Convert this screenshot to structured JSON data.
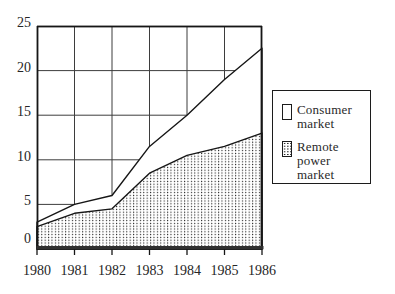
{
  "figure": {
    "background": "#ffffff",
    "line_color": "#161616",
    "grid_color": "#3d3d3d",
    "text_color": "#262626"
  },
  "chart_data": {
    "type": "area",
    "stacked": true,
    "title": "",
    "xlabel": "",
    "ylabel": "",
    "x": [
      1980,
      1981,
      1982,
      1983,
      1984,
      1985,
      1986
    ],
    "x_tick_labels": [
      "1980",
      "1981",
      "1982",
      "1983",
      "1984",
      "1985",
      "1986"
    ],
    "y_ticks": [
      0,
      5,
      10,
      15,
      20,
      25
    ],
    "y_tick_labels": [
      "0",
      "5",
      "10",
      "15",
      "20",
      "25"
    ],
    "ylim": [
      0,
      25
    ],
    "grid": true,
    "series": [
      {
        "name": "Remote power market",
        "fill": "dot-pattern",
        "values": [
          2.5,
          4,
          4.5,
          8.5,
          10.5,
          11.5,
          13
        ]
      },
      {
        "name": "Consumer market",
        "fill": "white",
        "values": [
          0.5,
          1,
          1.5,
          3,
          4.5,
          7.5,
          9.5
        ]
      }
    ],
    "stacked_totals": [
      3,
      5,
      6,
      11.5,
      15,
      19,
      22.5
    ],
    "legend": {
      "position": "right",
      "items": [
        {
          "line1": "Consumer",
          "line2": "market",
          "swatch": "white"
        },
        {
          "line1": "Remote power",
          "line2": "market",
          "swatch": "dotted"
        }
      ]
    }
  }
}
